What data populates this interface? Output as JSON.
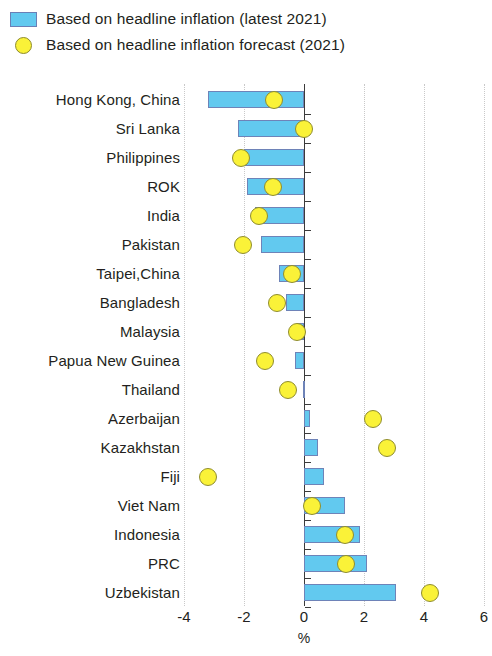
{
  "legend": {
    "items": [
      {
        "label": "Based on headline inflation (latest 2021)",
        "marker": "bar-swatch-icon",
        "color": "#62C9EF"
      },
      {
        "label": "Based on headline inflation forecast (2021)",
        "marker": "circle-marker-icon",
        "color": "#FAF238"
      }
    ]
  },
  "chart_data": {
    "type": "bar",
    "orientation": "horizontal",
    "title": "",
    "subtitle": "",
    "xlabel": "%",
    "ylabel": "",
    "xlim": [
      -4,
      6
    ],
    "xticks": [
      -4,
      -2,
      0,
      2,
      4,
      6
    ],
    "xticklabels": [
      "-4",
      "-2",
      "0",
      "2",
      "4",
      "6"
    ],
    "grid": "vertical-dotted",
    "legend_position": "top-left",
    "categories": [
      "Hong Kong, China",
      "Sri Lanka",
      "Philippines",
      "ROK",
      "India",
      "Pakistan",
      "Taipei,China",
      "Bangladesh",
      "Malaysia",
      "Papua New Guinea",
      "Thailand",
      "Azerbaijan",
      "Kazakhstan",
      "Fiji",
      "Viet Nam",
      "Indonesia",
      "PRC",
      "Uzbekistan"
    ],
    "series": [
      {
        "name": "Based on headline inflation (latest 2021)",
        "type": "bar",
        "color": "#62C9EF",
        "values": [
          -3.2,
          -2.2,
          -2.0,
          -1.9,
          -1.65,
          -1.45,
          -0.85,
          -0.6,
          -0.25,
          -0.3,
          -0.05,
          0.2,
          0.45,
          0.65,
          1.35,
          1.85,
          2.1,
          3.05
        ]
      },
      {
        "name": "Based on headline inflation forecast (2021)",
        "type": "scatter",
        "color": "#FAF238",
        "values": [
          -1.0,
          0.0,
          -2.1,
          -1.05,
          -1.5,
          -2.05,
          -0.4,
          -0.9,
          -0.25,
          -1.3,
          -0.55,
          2.3,
          2.75,
          -3.2,
          0.25,
          1.35,
          1.4,
          4.2
        ]
      }
    ]
  }
}
